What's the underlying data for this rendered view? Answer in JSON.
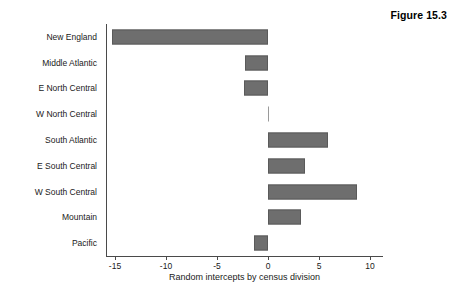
{
  "figure": {
    "caption": "Figure 15.3"
  },
  "chart_data": {
    "type": "bar",
    "orientation": "horizontal",
    "title": "",
    "xlabel": "Random intercepts by census division",
    "ylabel": "",
    "categories": [
      "New England",
      "Middle Atlantic",
      "E North Central",
      "W North Central",
      "South Atlantic",
      "E South Central",
      "W South Central",
      "Mountain",
      "Pacific"
    ],
    "values": [
      -15.3,
      -2.3,
      -2.4,
      0.0,
      5.9,
      3.6,
      8.7,
      3.2,
      -1.4
    ],
    "xlim": [
      -17,
      11.3
    ],
    "xticks": [
      -15,
      -10,
      -5,
      0,
      5,
      10
    ],
    "xtick_labels": [
      "-15",
      "-10",
      "-5",
      "0",
      "5",
      "10"
    ],
    "grid": false,
    "legend": false,
    "bar_color": "#6e6e6e",
    "bar_edge_color": "#5a5a5a",
    "axis_color": "#4a4a4a"
  }
}
